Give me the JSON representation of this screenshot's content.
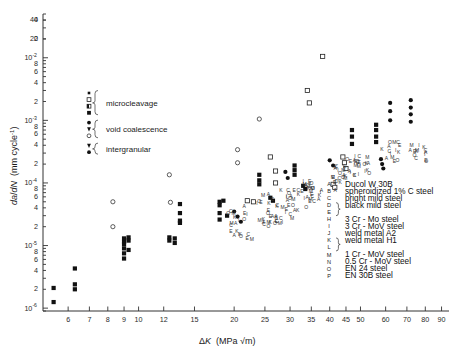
{
  "figure": {
    "title": "",
    "background": "#ffffff",
    "ink_color": "#1a1a1a"
  },
  "axes": {
    "x": {
      "label_delta": "Δ",
      "label_k": "K",
      "label_units": "(MPa √m)",
      "scale": "log",
      "min": 5,
      "max": 95,
      "ticks": [
        6,
        7,
        8,
        9,
        10,
        12,
        15,
        20,
        25,
        30,
        35,
        40,
        45,
        50,
        60,
        70,
        80,
        90
      ],
      "tick_labels": [
        "6",
        "7",
        "8",
        "9",
        "10",
        "12",
        "15",
        "20",
        "25",
        "30",
        "35",
        "40",
        "45",
        "50",
        "60",
        "70",
        "80",
        "90"
      ]
    },
    "y": {
      "label_num": "d",
      "label_a": "a",
      "label_den": "d",
      "label_n": "N",
      "label_units": "(mm cycle",
      "label_units_exp": "-1",
      "label_units_close": ")",
      "scale": "log",
      "min": 9e-07,
      "max": 0.05,
      "decade_labels": [
        {
          "value": 0.01,
          "mantissa": "10",
          "exponent": "-2"
        },
        {
          "value": 0.001,
          "mantissa": "10",
          "exponent": "-3"
        },
        {
          "value": 0.0001,
          "mantissa": "10",
          "exponent": "-4"
        },
        {
          "value": 1e-05,
          "mantissa": "10",
          "exponent": "-5"
        },
        {
          "value": 1e-06,
          "mantissa": "10",
          "exponent": "-6"
        }
      ],
      "minor_labels": [
        "2",
        "4",
        "6",
        "8",
        "20",
        "40"
      ]
    }
  },
  "mechanism_legend": {
    "groups": [
      {
        "name": "microcleavage",
        "label": "microcleavage",
        "markers": [
          "filled-square-small",
          "open-square",
          "half-square",
          "filled-square"
        ]
      },
      {
        "name": "void-coalescence",
        "label": "void  coalescence",
        "markers": [
          "filled-circle",
          "filled-triangle-down",
          "open-circle"
        ]
      },
      {
        "name": "intergranular",
        "label": "intergranular",
        "markers": [
          "filled-triangle-down",
          "filled-circle-dot"
        ]
      }
    ]
  },
  "material_legend": {
    "entries": [
      {
        "key": "A",
        "label": "Ducol W 30B"
      },
      {
        "key": "B",
        "label": "spheroidized 1% C steel"
      },
      {
        "key": "C",
        "label": "bright mild steel"
      },
      {
        "key": "D",
        "label": "black mild steel",
        "braced": true
      },
      {
        "key": "E",
        "label": "",
        "braced": true
      },
      {
        "key": "H",
        "label": "3 Cr - Mo steel"
      },
      {
        "key": "I",
        "label": "3 Cr - MoV steel"
      },
      {
        "key": "J",
        "label": "weld metal A2"
      },
      {
        "key": "K",
        "label": "weld metal H1",
        "braced": true
      },
      {
        "key": "L",
        "label": "",
        "braced": true
      },
      {
        "key": "M",
        "label": "1 Cr - MoV steel"
      },
      {
        "key": "N",
        "label": "0.5 Cr - MoV steel"
      },
      {
        "key": "O",
        "label": "EN 24 steel"
      },
      {
        "key": "P",
        "label": "EN 30B steel"
      }
    ]
  },
  "chart_data": {
    "type": "scatter",
    "title": "",
    "xlabel": "ΔK (MPa √m)",
    "ylabel": "da/dN (mm cycle⁻¹)",
    "xscale": "log",
    "yscale": "log",
    "xlim": [
      5,
      95
    ],
    "ylim": [
      9e-07,
      0.05
    ],
    "grid": false,
    "legend_position": "right-lower",
    "series": [
      {
        "name": "microcleavage",
        "marker": "filled-square",
        "points": [
          [
            5.4,
            2.1e-06
          ],
          [
            5.4,
            1.25e-06
          ],
          [
            6.3,
            2.4e-06
          ],
          [
            6.3,
            2e-06
          ],
          [
            6.3,
            4.3e-06
          ],
          [
            9.0,
            9e-06
          ],
          [
            9.0,
            1.15e-05
          ],
          [
            9.0,
            1.3e-05
          ],
          [
            9.0,
            1.05e-05
          ],
          [
            9.0,
            7.5e-06
          ],
          [
            9.0,
            6.2e-06
          ],
          [
            9.3,
            1.35e-05
          ],
          [
            9.3,
            1.2e-05
          ],
          [
            9.3,
            8.5e-06
          ],
          [
            12.5,
            1.2e-05
          ],
          [
            12.5,
            1.35e-05
          ],
          [
            13.0,
            1.3e-05
          ],
          [
            13.0,
            1.1e-05
          ],
          [
            13.5,
            2.3e-05
          ],
          [
            13.5,
            2.5e-05
          ],
          [
            13.5,
            4.6e-05
          ],
          [
            13.5,
            3.3e-05
          ],
          [
            18.0,
            5e-05
          ],
          [
            18.0,
            4.4e-05
          ],
          [
            18.0,
            3.3e-05
          ],
          [
            18.0,
            2.6e-05
          ],
          [
            18.5,
            5.2e-05
          ],
          [
            19.0,
            3e-05
          ],
          [
            24.0,
            0.000135
          ],
          [
            24.0,
            0.00011
          ],
          [
            24.0,
            9.5e-05
          ],
          [
            26.0,
            5.8e-05
          ],
          [
            26.5,
            5.2e-05
          ],
          [
            31.0,
            0.00019
          ],
          [
            31.0,
            0.00016
          ],
          [
            31.0,
            0.000135
          ],
          [
            33.0,
            9e-05
          ],
          [
            33.5,
            8e-05
          ],
          [
            47.0,
            0.0007
          ],
          [
            47.0,
            0.00055
          ],
          [
            47.0,
            0.00042
          ],
          [
            56.0,
            0.00085
          ],
          [
            56.0,
            0.0007
          ],
          [
            56.0,
            0.00055
          ],
          [
            56.0,
            0.00045
          ]
        ]
      },
      {
        "name": "open-square-microcleavage",
        "marker": "open-square",
        "points": [
          [
            26.0,
            0.00026
          ],
          [
            27.0,
            0.000155
          ],
          [
            27.0,
            0.0001
          ],
          [
            22.0,
            5.2e-05
          ],
          [
            23.0,
            5e-05
          ],
          [
            34.0,
            0.003
          ],
          [
            34.5,
            0.0019
          ],
          [
            38.0,
            0.0105
          ],
          [
            44.0,
            0.00026
          ],
          [
            44.5,
            0.00021
          ],
          [
            45.0,
            0.00017
          ],
          [
            41.0,
            9.5e-05
          ],
          [
            41.5,
            8.5e-05
          ]
        ]
      },
      {
        "name": "void-coalescence",
        "marker": "filled-circle",
        "points": [
          [
            20.0,
            3.5e-05
          ],
          [
            20.5,
            2.9e-05
          ],
          [
            21.0,
            2.4e-05
          ],
          [
            29.0,
            0.00015
          ],
          [
            29.5,
            0.00012
          ],
          [
            40.0,
            0.00023
          ],
          [
            41.0,
            0.00019
          ],
          [
            62.0,
            0.0019
          ],
          [
            62.0,
            0.0014
          ],
          [
            62.0,
            0.001
          ],
          [
            72.0,
            0.0021
          ],
          [
            72.0,
            0.0016
          ],
          [
            72.0,
            0.00125
          ],
          [
            72.0,
            0.00095
          ],
          [
            58.0,
            0.00024
          ],
          [
            58.5,
            0.0002
          ],
          [
            59.0,
            0.00017
          ]
        ]
      },
      {
        "name": "open-circle-mechanism",
        "marker": "open-circle",
        "points": [
          [
            8.3,
            5e-05
          ],
          [
            8.3,
            2e-05
          ],
          [
            12.5,
            0.000135
          ],
          [
            12.6,
            4.9e-05
          ],
          [
            20.5,
            0.00034
          ],
          [
            20.5,
            0.00021
          ],
          [
            24.0,
            0.00105
          ]
        ]
      },
      {
        "name": "lettered-materials",
        "marker": "letter",
        "points": [
          [
            21.0,
            2e-05
          ],
          [
            21.5,
            1.6e-05
          ],
          [
            22.0,
            1.25e-05
          ],
          [
            26.0,
            3e-05
          ],
          [
            26.5,
            2.5e-05
          ],
          [
            27.0,
            2.1e-05
          ],
          [
            27.5,
            1.7e-05
          ],
          [
            30.0,
            4.6e-05
          ],
          [
            30.5,
            3.8e-05
          ],
          [
            31.0,
            3.1e-05
          ],
          [
            35.0,
            7e-05
          ],
          [
            35.5,
            5.8e-05
          ],
          [
            36.0,
            4.8e-05
          ],
          [
            36.5,
            4e-05
          ],
          [
            44.0,
            0.00011
          ],
          [
            44.5,
            9e-05
          ],
          [
            45.0,
            7.5e-05
          ],
          [
            50.0,
            0.00016
          ],
          [
            51.0,
            0.00013
          ],
          [
            52.0,
            0.000105
          ],
          [
            64.0,
            0.00026
          ],
          [
            65.0,
            0.00021
          ],
          [
            78.0,
            0.00032
          ],
          [
            79.0,
            0.00026
          ]
        ]
      }
    ]
  }
}
